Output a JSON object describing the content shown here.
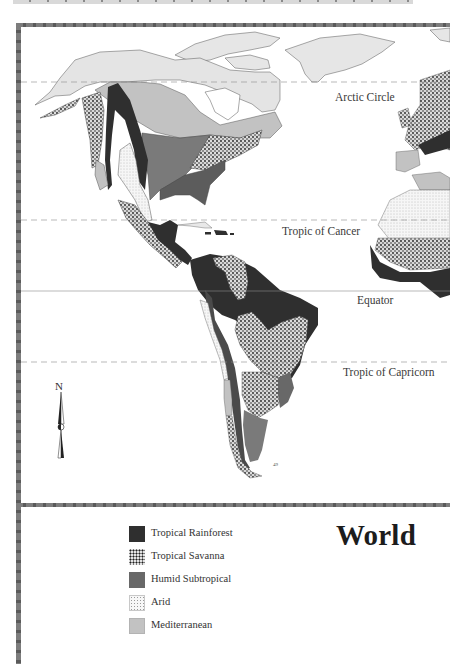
{
  "map": {
    "title": "World",
    "latitude_lines": [
      {
        "name": "Arctic Circle",
        "style": "dashed",
        "y": 82
      },
      {
        "name": "Tropic of Cancer",
        "style": "dashed",
        "y": 220
      },
      {
        "name": "Equator",
        "style": "solid",
        "y": 291
      },
      {
        "name": "Tropic of Capricorn",
        "style": "dashed",
        "y": 362
      }
    ],
    "compass": {
      "label": "N"
    },
    "misc_label": "49"
  },
  "legend": {
    "items": [
      {
        "label": "Tropical Rainforest",
        "pattern": "solid-dark",
        "color": "#2f2f2f"
      },
      {
        "label": "Tropical Savanna",
        "pattern": "speckled",
        "color": "#c9c9c9"
      },
      {
        "label": "Humid Subtropical",
        "pattern": "solid-medium",
        "color": "#686868"
      },
      {
        "label": "Arid",
        "pattern": "stippled",
        "color": "#f7f7f7"
      },
      {
        "label": "Mediterranean",
        "pattern": "solid-light",
        "color": "#c2c2c2"
      }
    ]
  },
  "colors": {
    "rainforest": "#2f2f2f",
    "humid_subtropical": "#686868",
    "mediterranean_land": "#c2c2c2",
    "tundra_light": "#e4e4e4",
    "frame": "#6e6e6e"
  }
}
